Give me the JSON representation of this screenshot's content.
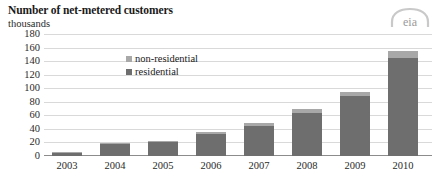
{
  "chart_data": {
    "type": "bar",
    "stacked": true,
    "title": "Number of net-metered customers",
    "subtitle": "thousands",
    "xlabel": "",
    "ylabel": "thousands",
    "ylim": [
      0,
      180
    ],
    "yticks": [
      0,
      20,
      40,
      60,
      80,
      100,
      120,
      140,
      160,
      180
    ],
    "ytick_labels": [
      "0",
      "20",
      "40",
      "60",
      "80",
      "100",
      "120",
      "140",
      "160",
      "180"
    ],
    "grid": true,
    "legend_position": "inside-upper-left",
    "categories": [
      "2003",
      "2004",
      "2005",
      "2006",
      "2007",
      "2008",
      "2009",
      "2010"
    ],
    "series": [
      {
        "name": "residential",
        "color": "#6e6e6e",
        "values": [
          5,
          17,
          20,
          32,
          44,
          64,
          88,
          145
        ]
      },
      {
        "name": "non-residential",
        "color": "#a8a8a8",
        "values": [
          1,
          2,
          2,
          3,
          4,
          6,
          7,
          10
        ]
      }
    ],
    "totals": [
      6,
      19,
      22,
      35,
      48,
      70,
      95,
      155
    ]
  },
  "legend": {
    "items": [
      {
        "label": "non-residential",
        "color": "#a8a8a8"
      },
      {
        "label": "residential",
        "color": "#6e6e6e"
      }
    ]
  },
  "branding": {
    "logo_text": "eia"
  }
}
